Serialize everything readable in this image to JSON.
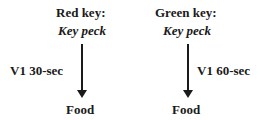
{
  "diagram": {
    "left": {
      "key_label": "Red key:",
      "response": "Key peck",
      "schedule": "V1 30-sec",
      "outcome": "Food"
    },
    "right": {
      "key_label": "Green key:",
      "response": "Key peck",
      "schedule": "V1 60-sec",
      "outcome": "Food"
    }
  }
}
